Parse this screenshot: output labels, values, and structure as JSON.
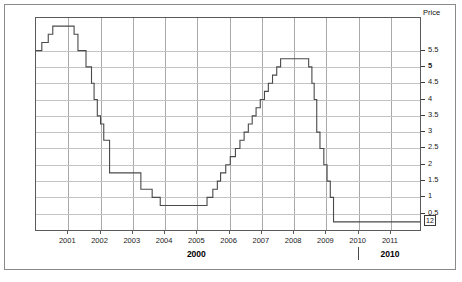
{
  "chart_data": {
    "type": "line",
    "title": "",
    "subtitle": "",
    "xlabel": "",
    "ylabel": "Price",
    "grid": true,
    "legend": null,
    "step_style": "post",
    "xlim": [
      2000.0,
      2011.9
    ],
    "ylim": [
      0.0,
      6.5
    ],
    "xticks": [
      "2001",
      "2002",
      "2003",
      "2004",
      "2005",
      "2006",
      "2007",
      "2008",
      "2009",
      "2010",
      "2011"
    ],
    "xtick_values": [
      2001,
      2002,
      2003,
      2004,
      2005,
      2006,
      2007,
      2008,
      2009,
      2010,
      2011
    ],
    "yticks": [
      "5.5",
      "5",
      "4.5",
      "4",
      "3.5",
      "3",
      "2.5",
      "2",
      "1.5",
      "1",
      "0.5"
    ],
    "ytick_values": [
      5.5,
      5.0,
      4.5,
      4.0,
      3.5,
      3.0,
      2.5,
      2.0,
      1.5,
      1.0,
      0.5
    ],
    "ytick_bold": [
      "5"
    ],
    "axis_header": "Price",
    "current_value_label": "12",
    "decade_labels": [
      {
        "text": "2000",
        "value": 2005.0
      },
      {
        "text": "2010",
        "value": 2011.0
      }
    ],
    "decade_tick_value": 2010.0,
    "series": [
      {
        "name": "Price",
        "color": "#4a4a4a",
        "points": [
          {
            "x": 2000.0,
            "y": 5.5
          },
          {
            "x": 2000.18,
            "y": 5.75
          },
          {
            "x": 2000.38,
            "y": 6.0
          },
          {
            "x": 2000.52,
            "y": 6.25
          },
          {
            "x": 2001.18,
            "y": 6.0
          },
          {
            "x": 2001.3,
            "y": 5.5
          },
          {
            "x": 2001.55,
            "y": 5.0
          },
          {
            "x": 2001.72,
            "y": 4.5
          },
          {
            "x": 2001.8,
            "y": 4.0
          },
          {
            "x": 2001.9,
            "y": 3.5
          },
          {
            "x": 2002.0,
            "y": 3.25
          },
          {
            "x": 2002.1,
            "y": 2.75
          },
          {
            "x": 2002.28,
            "y": 1.75
          },
          {
            "x": 2003.25,
            "y": 1.25
          },
          {
            "x": 2003.6,
            "y": 1.0
          },
          {
            "x": 2003.85,
            "y": 0.75
          },
          {
            "x": 2005.3,
            "y": 1.0
          },
          {
            "x": 2005.48,
            "y": 1.25
          },
          {
            "x": 2005.62,
            "y": 1.5
          },
          {
            "x": 2005.72,
            "y": 1.75
          },
          {
            "x": 2005.88,
            "y": 2.0
          },
          {
            "x": 2006.02,
            "y": 2.25
          },
          {
            "x": 2006.18,
            "y": 2.5
          },
          {
            "x": 2006.32,
            "y": 2.75
          },
          {
            "x": 2006.45,
            "y": 3.0
          },
          {
            "x": 2006.58,
            "y": 3.25
          },
          {
            "x": 2006.7,
            "y": 3.5
          },
          {
            "x": 2006.82,
            "y": 3.75
          },
          {
            "x": 2006.95,
            "y": 4.0
          },
          {
            "x": 2007.08,
            "y": 4.25
          },
          {
            "x": 2007.2,
            "y": 4.5
          },
          {
            "x": 2007.33,
            "y": 4.75
          },
          {
            "x": 2007.46,
            "y": 5.0
          },
          {
            "x": 2007.58,
            "y": 5.25
          },
          {
            "x": 2008.45,
            "y": 5.0
          },
          {
            "x": 2008.55,
            "y": 4.5
          },
          {
            "x": 2008.62,
            "y": 4.0
          },
          {
            "x": 2008.7,
            "y": 3.0
          },
          {
            "x": 2008.8,
            "y": 2.5
          },
          {
            "x": 2008.92,
            "y": 2.0
          },
          {
            "x": 2009.02,
            "y": 1.5
          },
          {
            "x": 2009.12,
            "y": 1.0
          },
          {
            "x": 2009.22,
            "y": 0.25
          },
          {
            "x": 2011.9,
            "y": 0.25
          }
        ]
      }
    ]
  }
}
